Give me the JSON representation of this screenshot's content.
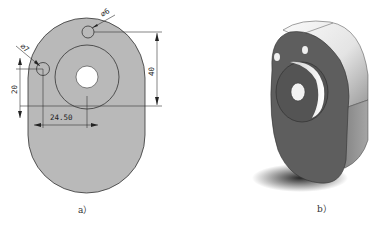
{
  "figure": {
    "panels": [
      {
        "id": "a",
        "caption": "a）",
        "type": "2d-dimensioned-drawing",
        "dimensions": {
          "hole_top_diameter": "⌀6",
          "hole_left_diameter": "⌀7",
          "vertical_right": "40",
          "vertical_left": "20",
          "horizontal_bottom": "24.50"
        }
      },
      {
        "id": "b",
        "caption": "b）",
        "type": "3d-shaded-model"
      }
    ],
    "colors": {
      "part_fill_2d": "#b9b9b9",
      "outline": "#333333",
      "hole_fill": "#ffffff",
      "model_face": "#5a5a5a",
      "model_side_light": "#f0f0f0",
      "model_side_shade": "#8a8a8a",
      "shadow": "#222222"
    }
  }
}
